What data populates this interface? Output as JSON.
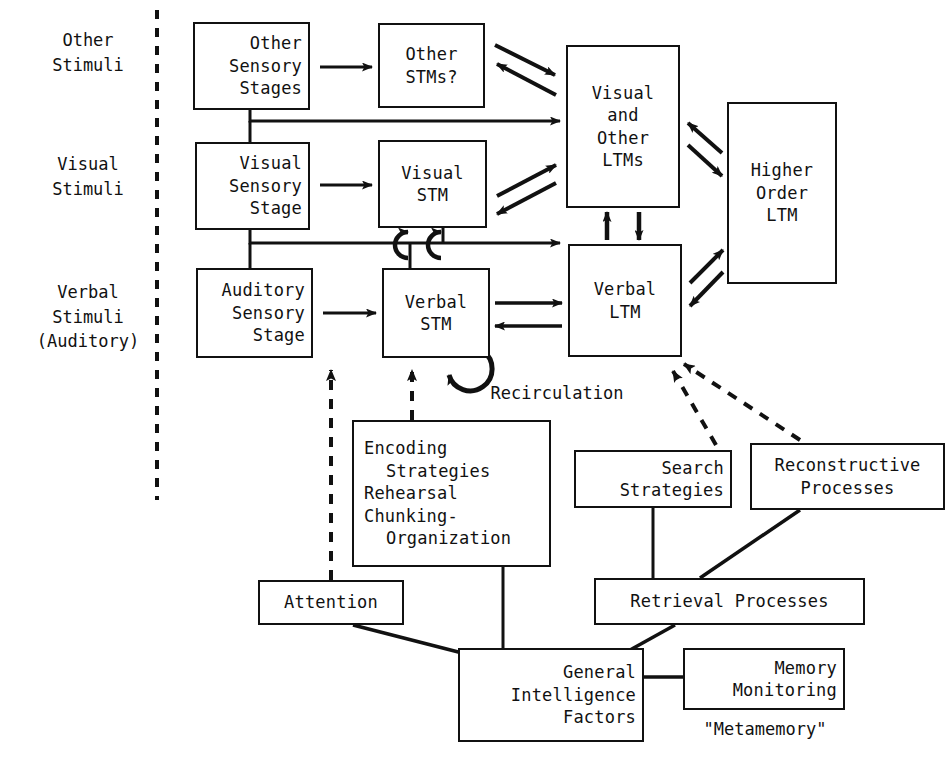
{
  "figure": {
    "kind": "memory-system-flow-diagram",
    "ink_color": "#111111",
    "background_color": "#ffffff"
  },
  "stimuli_labels": [
    {
      "id": "other",
      "text": "Other\nStimuli"
    },
    {
      "id": "visual",
      "text": "Visual\nStimuli"
    },
    {
      "id": "verbal",
      "text": "Verbal\nStimuli\n(Auditory)"
    }
  ],
  "divider": {
    "name": "stimuli-divider",
    "style": "dashed-vertical"
  },
  "boxes": {
    "other_sensory_stages": {
      "line1": "Other",
      "line2": "Sensory",
      "line3": "Stages"
    },
    "other_stms": {
      "line1": "Other",
      "line2": "STMs?"
    },
    "visual_sensory_stage": {
      "line1": "Visual",
      "line2": "Sensory",
      "line3": "Stage"
    },
    "visual_stm": {
      "line1": "Visual",
      "line2": "STM"
    },
    "auditory_sensory_stage": {
      "line1": "Auditory",
      "line2": "Sensory",
      "line3": "Stage"
    },
    "verbal_stm": {
      "line1": "Verbal",
      "line2": "STM"
    },
    "visual_and_other_ltms": {
      "line1": "Visual",
      "line2": "and",
      "line3": "Other",
      "line4": "LTMs"
    },
    "verbal_ltm": {
      "line1": "Verbal",
      "line2": "LTM"
    },
    "higher_order_ltm": {
      "line1": "Higher",
      "line2": "Order",
      "line3": "LTM"
    },
    "encoding_strategies": {
      "line1": "Encoding",
      "line2": "Strategies",
      "line3": "Rehearsal",
      "line4": "Chunking-",
      "line5": "Organization"
    },
    "search_strategies": {
      "line1": "Search",
      "line2": "Strategies"
    },
    "reconstructive_processes": {
      "line1": "Reconstructive",
      "line2": "Processes"
    },
    "retrieval_processes": {
      "line1": "Retrieval Processes"
    },
    "attention": {
      "line1": "Attention"
    },
    "general_intelligence_factors": {
      "line1": "General",
      "line2": "Intelligence",
      "line3": "Factors"
    },
    "memory_monitoring": {
      "line1": "Memory",
      "line2": "Monitoring"
    }
  },
  "annotations": {
    "recirculation": "Recirculation",
    "metamemory": "\"Metamemory\""
  }
}
